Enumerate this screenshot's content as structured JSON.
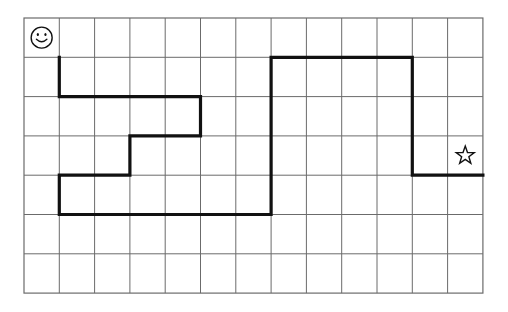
{
  "page": {
    "background_color": "#ffffff"
  },
  "grid": {
    "name": "puzzle-grid",
    "columns": 13,
    "rows": 7,
    "origin_x": 24,
    "origin_y": 18,
    "cell_width": 35.3,
    "cell_height": 39.3,
    "line_color": "#6b6b6b",
    "line_width": 1,
    "border_color": "#6b6b6b",
    "border_width": 1.2
  },
  "path": {
    "name": "drawn-path",
    "color": "#111111",
    "stroke_width": 3.2,
    "description": "Thick black path traced on grid lines from near the smiley to near the star",
    "points": [
      [
        1,
        1
      ],
      [
        1,
        2
      ],
      [
        5,
        2
      ],
      [
        5,
        3
      ],
      [
        3,
        3
      ],
      [
        3,
        4
      ],
      [
        1,
        4
      ],
      [
        1,
        5
      ],
      [
        7,
        5
      ],
      [
        7,
        1
      ],
      [
        11,
        1
      ],
      [
        11,
        4
      ],
      [
        13,
        4
      ]
    ]
  },
  "markers": [
    {
      "name": "smiley-icon",
      "glyph": "smiley-face",
      "cell_col": 0,
      "cell_row": 0,
      "color": "#111111",
      "label": "Start"
    },
    {
      "name": "star-icon",
      "glyph": "five-point-star",
      "cell_col": 12,
      "cell_row": 3,
      "color": "#111111",
      "label": "Goal"
    }
  ]
}
